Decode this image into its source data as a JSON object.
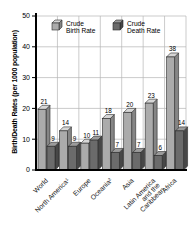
{
  "chart_data": {
    "type": "bar",
    "title": "",
    "ylabel": "Birth/Death Rates (per 1000 population)",
    "xlabel": "",
    "ylim": [
      0,
      50
    ],
    "yticks": [
      0,
      10,
      20,
      30,
      40,
      50
    ],
    "grid": true,
    "legend_position": "top-inside",
    "categories": [
      "World",
      "North America¹",
      "Europe",
      "Oceania²",
      "Asia",
      "Latin America and the Caribbean",
      "Africa"
    ],
    "category_display": [
      [
        "World"
      ],
      [
        "North America¹"
      ],
      [
        "Europe"
      ],
      [
        "Oceania²"
      ],
      [
        "Asia"
      ],
      [
        "Latin America",
        "and the",
        "Caribbean"
      ],
      [
        "Africa"
      ]
    ],
    "series": [
      {
        "name": "Crude Birth Rate",
        "legend_lines": [
          "Crude",
          "Birth Rate"
        ],
        "values": [
          21,
          14,
          10,
          18,
          20,
          23,
          38
        ],
        "color": "#ababab",
        "color_top": "#d6d6d6",
        "color_side": "#858585"
      },
      {
        "name": "Crude Death Rate",
        "legend_lines": [
          "Crude",
          "Death Rate"
        ],
        "values": [
          9,
          9,
          11,
          7,
          7,
          6,
          14
        ],
        "color": "#6b6b6b",
        "color_top": "#9b9b9b",
        "color_side": "#474747"
      }
    ],
    "colors": {
      "axis": "#000000",
      "grid": "#b5b5b5",
      "outline": "#2a2a2a",
      "text": "#000000"
    }
  }
}
